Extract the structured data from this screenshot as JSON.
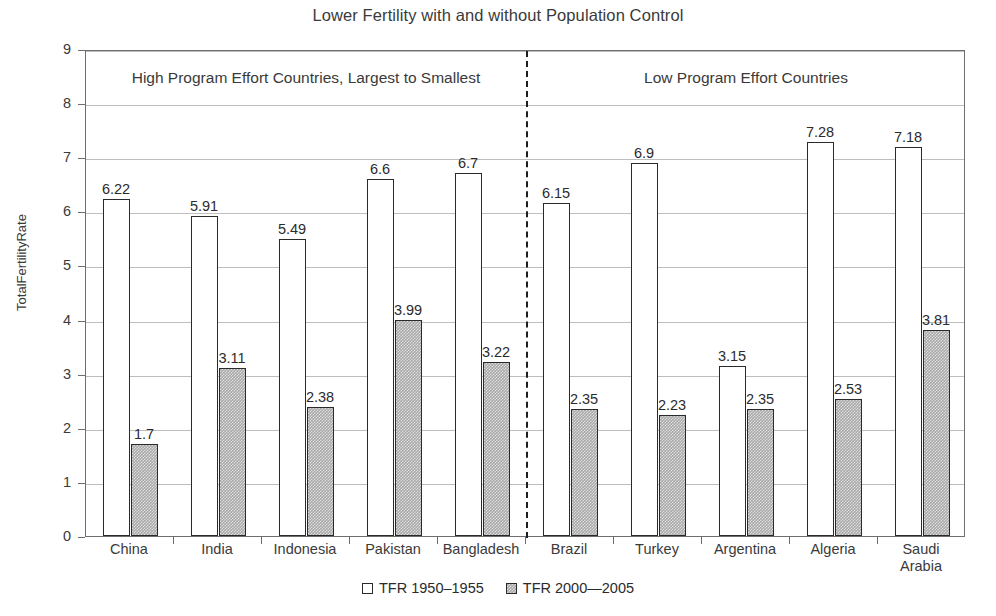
{
  "chart_data": {
    "type": "bar",
    "title": "Lower Fertility with and without Population Control",
    "xlabel": "",
    "ylabel": "TotalFertilityRate",
    "ylim": [
      0,
      9
    ],
    "ytick_labels": [
      "0",
      "1",
      "2",
      "3",
      "4",
      "5",
      "6",
      "7",
      "8",
      "9"
    ],
    "grid": true,
    "legend_position": "bottom-center",
    "categories": [
      "China",
      "India",
      "Indonesia",
      "Pakistan",
      "Bangladesh",
      "Brazil",
      "Turkey",
      "Argentina",
      "Algeria",
      "Saudi Arabia"
    ],
    "category_label_lines": [
      [
        "China"
      ],
      [
        "India"
      ],
      [
        "Indonesia"
      ],
      [
        "Pakistan"
      ],
      [
        "Bangladesh"
      ],
      [
        "Brazil"
      ],
      [
        "Turkey"
      ],
      [
        "Argentina"
      ],
      [
        "Algeria"
      ],
      [
        "Saudi",
        "Arabia"
      ]
    ],
    "series": [
      {
        "name": "TFR 1950–1955",
        "style": "white",
        "values": [
          6.22,
          5.91,
          5.49,
          6.6,
          6.7,
          6.15,
          6.9,
          3.15,
          7.28,
          7.18
        ],
        "value_labels": [
          "6.22",
          "5.91",
          "5.49",
          "6.6",
          "6.7",
          "6.15",
          "6.9",
          "3.15",
          "7.28",
          "7.18"
        ]
      },
      {
        "name": "TFR 2000—2005",
        "style": "gray",
        "values": [
          1.7,
          3.11,
          2.38,
          3.99,
          3.22,
          2.35,
          2.23,
          2.35,
          2.53,
          3.81
        ],
        "value_labels": [
          "1.7",
          "3.11",
          "2.38",
          "3.99",
          "3.22",
          "2.35",
          "2.23",
          "2.35",
          "2.53",
          "3.81"
        ]
      }
    ],
    "annotations": [
      {
        "id": "panel-left",
        "text": "High Program Effort Countries, Largest to Smallest"
      },
      {
        "id": "panel-right",
        "text": "Low Program Effort Countries"
      }
    ],
    "divider": {
      "after_category": "Bangladesh",
      "style": "dashed"
    },
    "colors": {
      "series_0_fill": "#ffffff",
      "series_1_fill": "#a9a9a9",
      "bar_outline": "#2a2a2a",
      "gridline": "#bdbdbd",
      "axis": "#6e6e6e",
      "text": "#2b2b2b",
      "background": "#ffffff"
    }
  },
  "legend": {
    "items": [
      {
        "label": "TFR 1950–1955"
      },
      {
        "label": "TFR 2000—2005"
      }
    ]
  }
}
